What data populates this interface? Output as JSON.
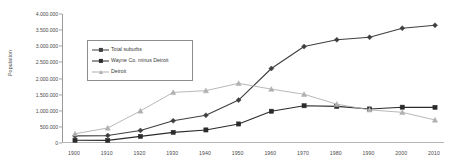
{
  "chart_data": {
    "type": "line",
    "title": "",
    "xlabel": "",
    "ylabel": "Population",
    "x": [
      1900,
      1910,
      1920,
      1930,
      1940,
      1950,
      1960,
      1970,
      1980,
      1990,
      2000,
      2010
    ],
    "xtick_labels": [
      "1900",
      "1910",
      "1920",
      "1930",
      "1940",
      "1950",
      "1960",
      "1970",
      "1980",
      "1990",
      "2000",
      "2010"
    ],
    "ytick_labels": [
      "0",
      "500.000",
      "1.000.000",
      "1.500.000",
      "2.000.000",
      "2.500.000",
      "3.000.000",
      "3.500.000",
      "4.000.000"
    ],
    "ytick_values": [
      0,
      500000,
      1000000,
      1500000,
      2000000,
      2500000,
      3000000,
      3500000,
      4000000
    ],
    "ylim": [
      0,
      4000000
    ],
    "grid": false,
    "legend_position": "upper-left-inset",
    "series": [
      {
        "name": "Total suburbs",
        "marker": "diamond",
        "color": "#3f3f3f",
        "values": [
          220000,
          230000,
          390000,
          690000,
          860000,
          1330000,
          2310000,
          2990000,
          3200000,
          3280000,
          3560000,
          3650000
        ]
      },
      {
        "name": "Wayne Co. minus Detroit",
        "marker": "square",
        "color": "#2b2b2b",
        "values": [
          85000,
          80000,
          205000,
          330000,
          405000,
          590000,
          985000,
          1155000,
          1135000,
          1055000,
          1110000,
          1105000
        ]
      },
      {
        "name": "Detroit",
        "marker": "triangle",
        "color": "#b0b0b0",
        "values": [
          286000,
          466000,
          994000,
          1569000,
          1623000,
          1850000,
          1670000,
          1511000,
          1203000,
          1028000,
          951000,
          714000
        ]
      }
    ]
  }
}
